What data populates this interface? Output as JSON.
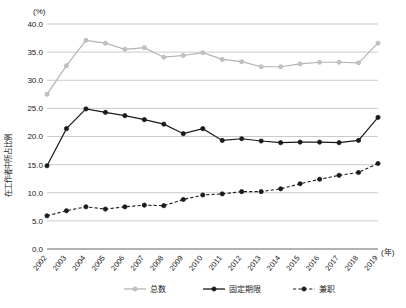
{
  "chart_data": {
    "type": "line",
    "title": "",
    "subtitle": "",
    "xlabel": "(年)",
    "ylabel": "在工作者中所占比例",
    "yunit": "(%)",
    "ylim": [
      0.0,
      40.0
    ],
    "ytick_step": 5.0,
    "grid": true,
    "legend_position": "bottom",
    "categories": [
      "2002",
      "2003",
      "2004",
      "2005",
      "2006",
      "2007",
      "2008",
      "2009",
      "2010",
      "2011",
      "2012",
      "2013",
      "2014",
      "2015",
      "2016",
      "2017",
      "2018",
      "2019"
    ],
    "x": [
      "2002",
      "2003",
      "2004",
      "2005",
      "2006",
      "2007",
      "2008",
      "2009",
      "2010",
      "2011",
      "2012",
      "2013",
      "2014",
      "2015",
      "2016",
      "2017",
      "2018",
      "2019"
    ],
    "ytick_labels": [
      "0.0",
      "5.0",
      "10.0",
      "15.0",
      "20.0",
      "25.0",
      "30.0",
      "35.0",
      "40.0"
    ],
    "series": [
      {
        "name": "总数",
        "color": "#b3b3b3",
        "style": "solid",
        "marker": "circle",
        "values": [
          27.5,
          32.6,
          37.1,
          36.6,
          35.5,
          35.8,
          34.1,
          34.4,
          34.9,
          33.7,
          33.3,
          32.4,
          32.4,
          32.9,
          33.2,
          33.2,
          33.1,
          36.6
        ]
      },
      {
        "name": "固定期限",
        "color": "#1a1a1a",
        "style": "solid",
        "marker": "filled-circle",
        "values": [
          14.8,
          21.4,
          24.9,
          24.3,
          23.7,
          23.0,
          22.2,
          20.5,
          21.4,
          19.3,
          19.6,
          19.2,
          18.9,
          19.0,
          19.0,
          18.9,
          19.3,
          23.4
        ]
      },
      {
        "name": "兼职",
        "color": "#1a1a1a",
        "style": "dashed",
        "marker": "filled-circle",
        "values": [
          5.9,
          6.8,
          7.5,
          7.1,
          7.5,
          7.8,
          7.7,
          8.8,
          9.6,
          9.8,
          10.2,
          10.2,
          10.7,
          11.6,
          12.4,
          13.1,
          13.6,
          15.2
        ]
      }
    ]
  },
  "legend": {
    "items": [
      {
        "label": "总数"
      },
      {
        "label": "固定期限"
      },
      {
        "label": "兼职"
      }
    ]
  }
}
